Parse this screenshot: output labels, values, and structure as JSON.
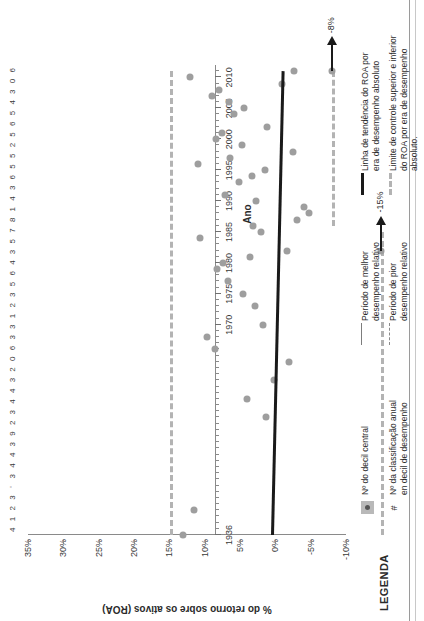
{
  "chart_data": {
    "type": "scatter",
    "title": "",
    "xlabel": "Ano",
    "ylabel": "% do retorno sobre os ativos (ROA)",
    "ylim": [
      -10,
      35
    ],
    "yticks": [
      "35%",
      "30%",
      "25%",
      "20%",
      "15%",
      "10%",
      "5%",
      "0%",
      "-5%",
      "-10%"
    ],
    "ytick_values": [
      35,
      30,
      25,
      20,
      15,
      10,
      5,
      0,
      -5,
      -10
    ],
    "xlim": [
      1936,
      2012
    ],
    "xticks": [
      "1936",
      "1970",
      "1975",
      "1980",
      "1985",
      "1990",
      "1995",
      "2000",
      "2005",
      "2010"
    ],
    "xtick_values": [
      1936,
      1970,
      1975,
      1980,
      1985,
      1990,
      1995,
      2000,
      2005,
      2010
    ],
    "grid": false,
    "legend_position": "bottom",
    "series": [
      {
        "name": "ROA anual",
        "marker": "circle",
        "color": "#9e9e9e",
        "points": [
          {
            "x": 1936,
            "y": 13.0
          },
          {
            "x": 1940,
            "y": 11.5
          },
          {
            "x": 1955,
            "y": 1.3
          },
          {
            "x": 1958,
            "y": 4.0
          },
          {
            "x": 1961,
            "y": 0.2
          },
          {
            "x": 1964,
            "y": -2.0
          },
          {
            "x": 1966,
            "y": 8.5
          },
          {
            "x": 1968,
            "y": 9.6
          },
          {
            "x": 1970,
            "y": 1.8
          },
          {
            "x": 1973,
            "y": 2.9
          },
          {
            "x": 1975,
            "y": 4.6
          },
          {
            "x": 1977,
            "y": 6.7
          },
          {
            "x": 1979,
            "y": 8.2
          },
          {
            "x": 1980,
            "y": 7.4
          },
          {
            "x": 1981,
            "y": 3.6
          },
          {
            "x": 1982,
            "y": -1.6
          },
          {
            "x": 1984,
            "y": 10.6
          },
          {
            "x": 1985,
            "y": 2.0
          },
          {
            "x": 1986,
            "y": 3.1
          },
          {
            "x": 1987,
            "y": -3.0
          },
          {
            "x": 1988,
            "y": -4.8
          },
          {
            "x": 1989,
            "y": -4.0
          },
          {
            "x": 1990,
            "y": 2.7
          },
          {
            "x": 1991,
            "y": 7.1
          },
          {
            "x": 1993,
            "y": 5.2
          },
          {
            "x": 1994,
            "y": 3.3
          },
          {
            "x": 1995,
            "y": 1.5
          },
          {
            "x": 1996,
            "y": 10.9
          },
          {
            "x": 1997,
            "y": 6.4
          },
          {
            "x": 1998,
            "y": -2.5
          },
          {
            "x": 1999,
            "y": 4.7
          },
          {
            "x": 2000,
            "y": 8.4
          },
          {
            "x": 2001,
            "y": 7.5
          },
          {
            "x": 2002,
            "y": 1.2
          },
          {
            "x": 2004,
            "y": 5.8
          },
          {
            "x": 2005,
            "y": 4.4
          },
          {
            "x": 2006,
            "y": 6.6
          },
          {
            "x": 2007,
            "y": 9.0
          },
          {
            "x": 2008,
            "y": 8.0
          },
          {
            "x": 2009,
            "y": -1.0
          },
          {
            "x": 2010,
            "y": 12.1
          },
          {
            "x": 2011,
            "y": -2.6
          }
        ]
      }
    ],
    "trend_line": {
      "name": "Linha de tendência do ROA por era de desempenho absoluto",
      "color": "#1a1a1a",
      "x_start": 1936,
      "y_start": 0.6,
      "x_end": 2011,
      "y_end": -0.9
    },
    "control_limits": [
      {
        "name": "Limite superior",
        "y": 14.9,
        "x_start": 1936,
        "x_end": 2011
      },
      {
        "name": "Limite inferior baixo",
        "y": -8.0,
        "x_start": 1986,
        "x_end": 2011
      },
      {
        "name": "Limite inferior alto",
        "y": -15.0,
        "x_start": 1936,
        "x_end": 1985
      }
    ],
    "annotations": [
      {
        "text": "-8%",
        "x": 2011,
        "y": -8.0
      },
      {
        "text": "-15%",
        "x": 1982,
        "y": -15.0
      }
    ],
    "decile_row": {
      "label": "Nº da classificação anual em decil de desempenho",
      "values": [
        "4",
        "1",
        "2",
        "3",
        "'",
        "3",
        "4",
        "4",
        "3",
        "9",
        "2",
        "3",
        "4",
        "4",
        "3",
        "2",
        "0",
        "6",
        "3",
        "3",
        "1",
        "2",
        "3",
        "5",
        "6",
        "4",
        "3",
        "5",
        "7",
        "8",
        "1",
        "4",
        "3",
        "6",
        "5",
        "5",
        "2",
        "5",
        "6",
        "5",
        "4",
        "3",
        "0",
        "6"
      ]
    }
  },
  "legend": {
    "title": "LEGENDA",
    "entries": [
      {
        "key": "square-marker",
        "text_lines": [
          "Nº  do decil central"
        ]
      },
      {
        "key": "hash",
        "text_lines": [
          "Nº da classificação anual",
          "en decil de desempenho"
        ]
      },
      {
        "key": "solid-thin",
        "text_lines": [
          "Período de melhor",
          "desempenho relativo"
        ]
      },
      {
        "key": "dashed-thin",
        "text_lines": [
          "Período de pior",
          "desempenho relativo"
        ]
      },
      {
        "key": "solid-thick",
        "text_lines": [
          "Linha de tendência do ROA por",
          "era de desempenho absoluto"
        ]
      },
      {
        "key": "dashed-thick",
        "text_lines": [
          "Limite de controle superior e inferior",
          "do ROA por era de desempenho",
          "absoluto."
        ]
      }
    ]
  },
  "colors": {
    "point": "#9e9e9e",
    "trend": "#1a1a1a",
    "control": "#b3b3b3",
    "axis": "#8a8a8a",
    "text": "#2b2b2b"
  }
}
